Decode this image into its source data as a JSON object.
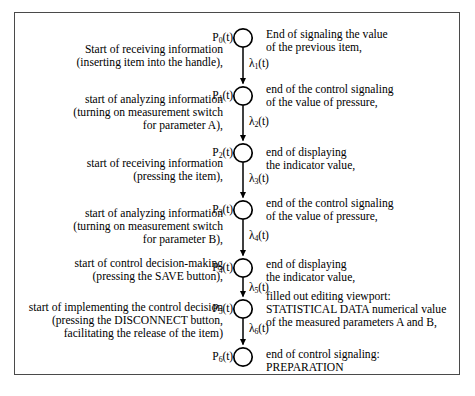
{
  "figure": {
    "type": "petri-net",
    "title": "",
    "orientation": "vertical",
    "place_count": 7,
    "transition_count": 6,
    "border_color": "#4a4a4a"
  },
  "places": [
    {
      "id": "P0",
      "label": "P",
      "sub": "0",
      "suffix": "(t)",
      "cx": 228,
      "cy": 25
    },
    {
      "id": "P1",
      "label": "P",
      "sub": "1",
      "suffix": "(t)",
      "cx": 228,
      "cy": 83
    },
    {
      "id": "P2",
      "label": "P",
      "sub": "2",
      "suffix": "(t)",
      "cx": 228,
      "cy": 140
    },
    {
      "id": "P3",
      "label": "P",
      "sub": "3",
      "suffix": "(t)",
      "cx": 228,
      "cy": 197
    },
    {
      "id": "P4",
      "label": "P",
      "sub": "4",
      "suffix": "(t)",
      "cx": 228,
      "cy": 255
    },
    {
      "id": "P5",
      "label": "P",
      "sub": "5",
      "suffix": "(t)",
      "cx": 228,
      "cy": 296
    },
    {
      "id": "P6",
      "label": "P",
      "sub": "6",
      "suffix": "(t)",
      "cx": 228,
      "cy": 344
    }
  ],
  "transitions": [
    {
      "id": "L1",
      "label": "λ",
      "sub": "1",
      "suffix": "(t)"
    },
    {
      "id": "L2",
      "label": "λ",
      "sub": "2",
      "suffix": "(t)"
    },
    {
      "id": "L3",
      "label": "λ",
      "sub": "3",
      "suffix": "(t)"
    },
    {
      "id": "L4",
      "label": "λ",
      "sub": "4",
      "suffix": "(t)"
    },
    {
      "id": "L5",
      "label": "λ",
      "sub": "5",
      "suffix": "(t)"
    },
    {
      "id": "L6",
      "label": "λ",
      "sub": "6",
      "suffix": "(t)"
    }
  ],
  "annotations_left": [
    "Start of receiving information\n(inserting item into the handle),",
    "start of analyzing information\n(turning on measurement switch\nfor parameter A),",
    "start of receiving information\n(pressing the item),",
    "start of analyzing information\n(turning on measurement switch\nfor parameter B),",
    "start of control decision-making\n(pressing the SAVE button),",
    "start of implementing the control decision\n(pressing the DISCONNECT button,\nfacilitating the release of the item)"
  ],
  "annotations_right": [
    "End of signaling the value\nof the previous item,",
    "end of the control signaling\nof the value of pressure,",
    "end of displaying\nthe indicator value,",
    "end of the control signaling\nof the value of pressure,",
    "end of displaying\nthe indicator value,",
    "filled out editing viewport:\nSTATISTICAL DATA numerical value\nof the measured parameters A and B,",
    "end of control signaling:\nPREPARATION"
  ]
}
